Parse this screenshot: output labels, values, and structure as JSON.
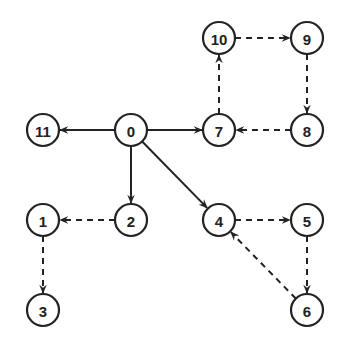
{
  "diagram": {
    "type": "directed-graph",
    "node_radius": 16,
    "stroke_color": "#222222",
    "nodes": [
      {
        "id": "0",
        "label": "0",
        "x": 131,
        "y": 130
      },
      {
        "id": "11",
        "label": "11",
        "x": 43,
        "y": 130
      },
      {
        "id": "7",
        "label": "7",
        "x": 219,
        "y": 130
      },
      {
        "id": "10",
        "label": "10",
        "x": 219,
        "y": 38
      },
      {
        "id": "9",
        "label": "9",
        "x": 307,
        "y": 38
      },
      {
        "id": "8",
        "label": "8",
        "x": 307,
        "y": 130
      },
      {
        "id": "2",
        "label": "2",
        "x": 131,
        "y": 220
      },
      {
        "id": "1",
        "label": "1",
        "x": 43,
        "y": 220
      },
      {
        "id": "3",
        "label": "3",
        "x": 43,
        "y": 310
      },
      {
        "id": "4",
        "label": "4",
        "x": 219,
        "y": 220
      },
      {
        "id": "5",
        "label": "5",
        "x": 307,
        "y": 220
      },
      {
        "id": "6",
        "label": "6",
        "x": 307,
        "y": 310
      }
    ],
    "edges": [
      {
        "from": "0",
        "to": "11",
        "style": "solid"
      },
      {
        "from": "0",
        "to": "7",
        "style": "solid"
      },
      {
        "from": "0",
        "to": "2",
        "style": "solid"
      },
      {
        "from": "0",
        "to": "4",
        "style": "solid"
      },
      {
        "from": "7",
        "to": "10",
        "style": "dashed"
      },
      {
        "from": "10",
        "to": "9",
        "style": "dashed"
      },
      {
        "from": "9",
        "to": "8",
        "style": "dashed"
      },
      {
        "from": "8",
        "to": "7",
        "style": "dashed"
      },
      {
        "from": "2",
        "to": "1",
        "style": "dashed"
      },
      {
        "from": "1",
        "to": "3",
        "style": "dashed"
      },
      {
        "from": "4",
        "to": "5",
        "style": "dashed"
      },
      {
        "from": "5",
        "to": "6",
        "style": "dashed"
      },
      {
        "from": "6",
        "to": "4",
        "style": "dashed"
      }
    ]
  }
}
